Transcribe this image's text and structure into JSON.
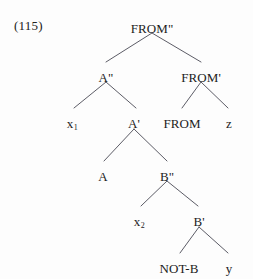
{
  "figure": {
    "example_number": "(115)",
    "type": "syntax-tree",
    "background_color": "#fdfdfd",
    "line_color": "#4a4a55",
    "text_color": "#1c1c1c"
  },
  "nodes": [
    {
      "id": "root",
      "label": "FROM\"",
      "x": 152,
      "y": 22,
      "anchor_y": 33
    },
    {
      "id": "a2",
      "label": "A\"",
      "x": 106,
      "y": 71,
      "anchor_y": 82
    },
    {
      "id": "from1",
      "label": "FROM'",
      "x": 201,
      "y": 71,
      "anchor_y": 82
    },
    {
      "id": "x1",
      "label": "x",
      "sub": "1",
      "x": 72,
      "y": 117,
      "anchor_y": 117
    },
    {
      "id": "a1",
      "label": "A'",
      "x": 134,
      "y": 117,
      "anchor_y": 129
    },
    {
      "id": "from0",
      "label": "FROM",
      "x": 182,
      "y": 117,
      "anchor_y": 117
    },
    {
      "id": "z",
      "label": "z",
      "x": 229,
      "y": 117,
      "anchor_y": 117
    },
    {
      "id": "a0",
      "label": "A",
      "x": 103,
      "y": 170,
      "anchor_y": 170
    },
    {
      "id": "b2",
      "label": "B\"",
      "x": 167,
      "y": 170,
      "anchor_y": 181
    },
    {
      "id": "x2",
      "label": "x",
      "sub": "2",
      "x": 139,
      "y": 215,
      "anchor_y": 215
    },
    {
      "id": "b1",
      "label": "B'",
      "x": 199,
      "y": 215,
      "anchor_y": 227
    },
    {
      "id": "notb",
      "label": "NOT-B",
      "x": 179,
      "y": 262,
      "anchor_y": 262
    },
    {
      "id": "y",
      "label": "y",
      "x": 229,
      "y": 262,
      "anchor_y": 262
    }
  ],
  "edges": [
    {
      "from": "root",
      "to": "a2",
      "x1": 152,
      "y1": 33,
      "x2": 106,
      "y2": 62
    },
    {
      "from": "root",
      "to": "from1",
      "x1": 152,
      "y1": 33,
      "x2": 201,
      "y2": 62
    },
    {
      "from": "a2",
      "to": "x1",
      "x1": 106,
      "y1": 82,
      "x2": 74,
      "y2": 108
    },
    {
      "from": "a2",
      "to": "a1",
      "x1": 106,
      "y1": 82,
      "x2": 136,
      "y2": 108
    },
    {
      "from": "from1",
      "to": "from0",
      "x1": 201,
      "y1": 82,
      "x2": 182,
      "y2": 108
    },
    {
      "from": "from1",
      "to": "z",
      "x1": 201,
      "y1": 82,
      "x2": 228,
      "y2": 108
    },
    {
      "from": "a1",
      "to": "a0",
      "x1": 134,
      "y1": 129,
      "x2": 104,
      "y2": 161
    },
    {
      "from": "a1",
      "to": "b2",
      "x1": 134,
      "y1": 129,
      "x2": 167,
      "y2": 161
    },
    {
      "from": "b2",
      "to": "x2",
      "x1": 167,
      "y1": 181,
      "x2": 141,
      "y2": 206
    },
    {
      "from": "b2",
      "to": "b1",
      "x1": 167,
      "y1": 181,
      "x2": 198,
      "y2": 206
    },
    {
      "from": "b1",
      "to": "notb",
      "x1": 199,
      "y1": 227,
      "x2": 180,
      "y2": 253
    },
    {
      "from": "b1",
      "to": "y",
      "x1": 199,
      "y1": 227,
      "x2": 228,
      "y2": 253
    }
  ]
}
